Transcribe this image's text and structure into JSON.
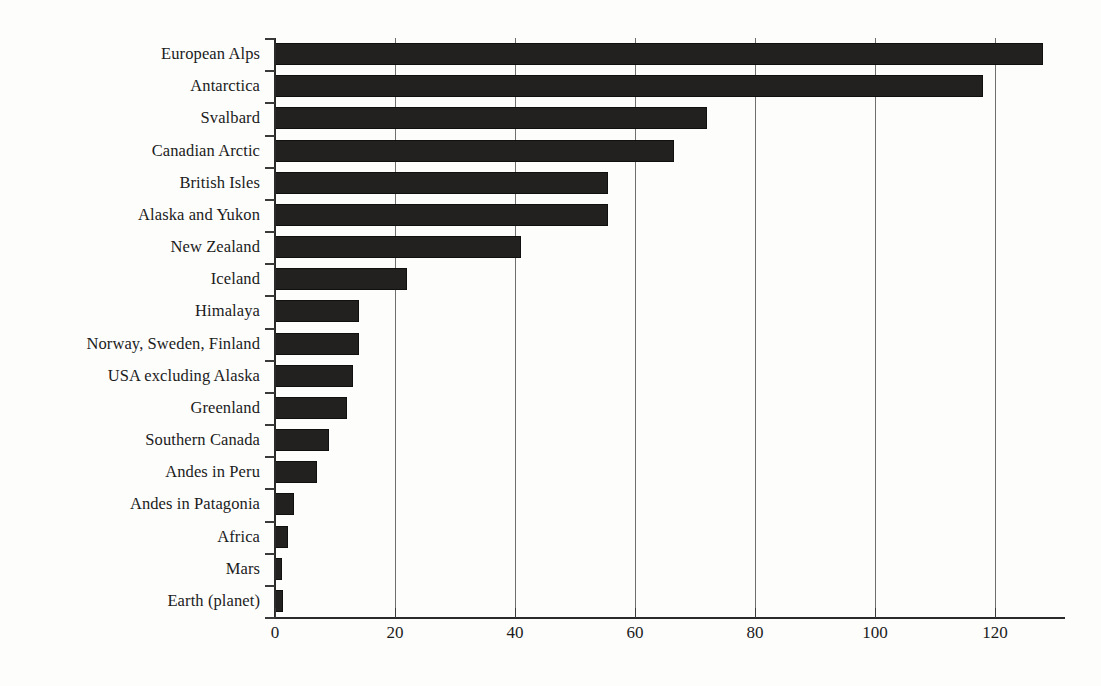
{
  "chart_data": {
    "type": "bar",
    "orientation": "horizontal",
    "title": "",
    "subtitle": "",
    "xlabel": "",
    "ylabel": "",
    "xlim": [
      0,
      131
    ],
    "ylim": null,
    "grid": "vertical gridlines at each x tick",
    "legend": "none",
    "bar_color": "#222120",
    "axis_color": "#2a2a2a",
    "gridline_color": "#6f6f6f",
    "background_color": "#fdfdfc",
    "xticks": [
      0,
      20,
      40,
      60,
      80,
      100,
      120
    ],
    "xtick_labels": [
      "0",
      "20",
      "40",
      "60",
      "80",
      "100",
      "120"
    ],
    "categories": [
      "European Alps",
      "Antarctica",
      "Svalbard",
      "Canadian Arctic",
      "British Isles",
      "Alaska and Yukon",
      "New Zealand",
      "Iceland",
      "Himalaya",
      "Norway, Sweden, Finland",
      "USA excluding Alaska",
      "Greenland",
      "Southern Canada",
      "Andes in Peru",
      "Andes in Patagonia",
      "Africa",
      "Mars",
      "Earth (planet)"
    ],
    "values": [
      128,
      118,
      72,
      66.5,
      55.5,
      55.5,
      41,
      22,
      14,
      14,
      13,
      12,
      9,
      7,
      3.2,
      2.2,
      1.2,
      1.4
    ]
  }
}
